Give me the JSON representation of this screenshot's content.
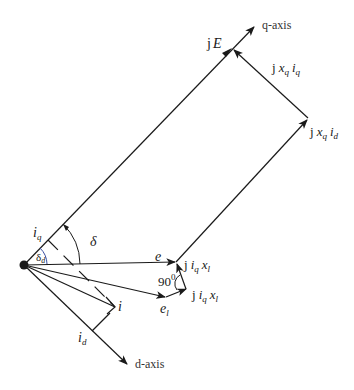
{
  "diagram": {
    "type": "phasor-diagram",
    "axes": {
      "q_axis": "q-axis",
      "d_axis": "d-axis"
    },
    "phasors": {
      "jE": {
        "prefix": "j",
        "symbol": "E"
      },
      "e": {
        "symbol": "e"
      },
      "e_l": {
        "symbol": "e",
        "sub": "l"
      },
      "i": {
        "symbol": "i"
      },
      "jxq_iq": {
        "prefix": "j",
        "x": "x",
        "x_sub": "q",
        "i": "i",
        "i_sub": "q"
      },
      "jxq_id": {
        "prefix": "j",
        "x": "x",
        "x_sub": "q",
        "i": "i",
        "i_sub": "d"
      },
      "jiq_xl_upper": {
        "prefix": "j",
        "i": "i",
        "i_sub": "q",
        "x": "x",
        "x_sub": "l"
      },
      "jiq_xl_lower": {
        "prefix": "j",
        "i": "i",
        "i_sub": "q",
        "x": "x",
        "x_sub": "l"
      }
    },
    "components": {
      "i_q": {
        "symbol": "i",
        "sub": "q"
      },
      "i_d": {
        "symbol": "i",
        "sub": "d"
      }
    },
    "angles": {
      "delta": "δ",
      "delta_d": {
        "symbol": "δ",
        "sub": "d"
      },
      "right_angle": {
        "value": "90",
        "sup": "0"
      }
    },
    "colors": {
      "line": "#1a1a1a",
      "delta_d_arc": "#3b4fa0"
    }
  }
}
